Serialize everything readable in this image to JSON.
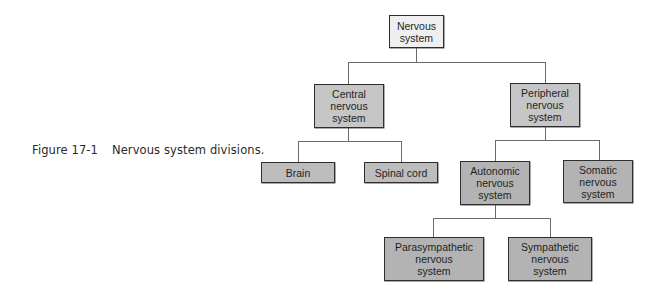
{
  "caption": {
    "figure_number": "Figure 17-1",
    "text": "Nervous system divisions."
  },
  "diagram": {
    "type": "hierarchy",
    "root": {
      "label": "Nervous\nsystem",
      "fill": "#efefef"
    },
    "level1": [
      {
        "label": "Central\nnervous\nsystem",
        "fill": "#c6c6c6"
      },
      {
        "label": "Peripheral\nnervous\nsystem",
        "fill": "#c6c6c6"
      }
    ],
    "central_children": [
      {
        "label": "Brain",
        "fill": "#bdbdbd"
      },
      {
        "label": "Spinal cord",
        "fill": "#bdbdbd"
      }
    ],
    "peripheral_children": [
      {
        "label": "Autonomic\nnervous\nsystem",
        "fill": "#b3b3b3"
      },
      {
        "label": "Somatic\nnervous\nsystem",
        "fill": "#b3b3b3"
      }
    ],
    "autonomic_children": [
      {
        "label": "Parasympathetic\nnervous\nsystem",
        "fill": "#b3b3b3"
      },
      {
        "label": "Sympathetic\nnervous\nsystem",
        "fill": "#b3b3b3"
      }
    ]
  }
}
